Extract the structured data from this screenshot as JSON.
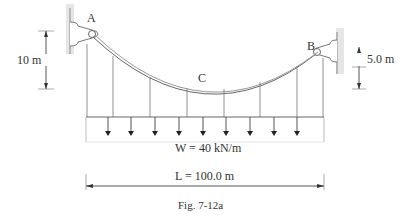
{
  "figure": {
    "caption": "Fig. 7-12a",
    "points": {
      "A": "A",
      "B": "B",
      "C": "C"
    },
    "dimensions": {
      "left_height": "10 m",
      "right_height": "5.0 m",
      "span": "L = 100.0 m"
    },
    "load": {
      "label": "W = 40 kN/m",
      "arrow_count": 9
    },
    "hangers": {
      "count": 7
    }
  },
  "colors": {
    "line": "#555555",
    "support": "#bbbbbb",
    "text": "#333333"
  }
}
